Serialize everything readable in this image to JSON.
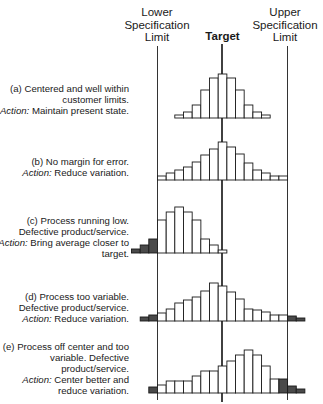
{
  "headers": {
    "lower_spec_limit": "Lower Specification Limit",
    "target": "Target",
    "upper_spec_limit": "Upper Specification Limit"
  },
  "panels": [
    {
      "id": "a",
      "label": "(a) Centered and well within customer limits.",
      "action_prefix": "Action:",
      "action": "Maintain present state.",
      "bars": [
        3,
        6,
        13,
        28,
        40,
        44,
        40,
        28,
        13,
        6,
        3
      ],
      "defective": [
        false,
        false,
        false,
        false,
        false,
        false,
        false,
        false,
        false,
        false,
        false
      ],
      "start_bin": 2
    },
    {
      "id": "b",
      "label": "(b) No margin for error.",
      "action_prefix": "Action:",
      "action": "Reduce variation.",
      "bars": [
        4,
        7,
        10,
        13,
        18,
        25,
        31,
        38,
        33,
        26,
        17,
        10,
        7,
        4,
        4
      ],
      "defective": [
        false,
        false,
        false,
        false,
        false,
        false,
        false,
        false,
        false,
        false,
        false,
        false,
        false,
        false,
        false
      ],
      "start_bin": 0
    },
    {
      "id": "c",
      "label": "(c) Process running low. Defective product/service.",
      "action_prefix": "Action:",
      "action": "Bring average closer to target.",
      "bars": [
        4,
        8,
        14,
        33,
        41,
        46,
        41,
        33,
        14,
        8,
        3
      ],
      "defective": [
        true,
        true,
        true,
        false,
        false,
        false,
        false,
        false,
        false,
        false,
        false
      ],
      "start_bin": -3
    },
    {
      "id": "d",
      "label": "(d) Process too variable. Defective product/service.",
      "action_prefix": "Action:",
      "action": "Reduce variation.",
      "bars": [
        4,
        6,
        8,
        12,
        18,
        21,
        24,
        30,
        38,
        35,
        29,
        22,
        12,
        11,
        9,
        6,
        6,
        5,
        3
      ],
      "defective": [
        true,
        true,
        false,
        false,
        false,
        false,
        false,
        false,
        false,
        false,
        false,
        false,
        false,
        false,
        false,
        false,
        false,
        true,
        true
      ],
      "start_bin": -2
    },
    {
      "id": "e",
      "label": "(e) Process off center and too variable. Defective product/service.",
      "action_prefix": "Action:",
      "action": "Center better and reduce variation.",
      "bars": [
        6,
        8,
        12,
        12,
        12,
        17,
        22,
        22,
        27,
        32,
        38,
        43,
        38,
        27,
        14,
        14,
        7,
        4
      ],
      "defective": [
        true,
        false,
        false,
        false,
        false,
        false,
        false,
        false,
        false,
        false,
        false,
        false,
        false,
        false,
        false,
        true,
        true,
        true
      ],
      "start_bin": -1
    }
  ],
  "colors": {
    "bar_fill": "#ffffff",
    "defect_fill": "#4a4a4a",
    "line": "#1a1a1a"
  }
}
